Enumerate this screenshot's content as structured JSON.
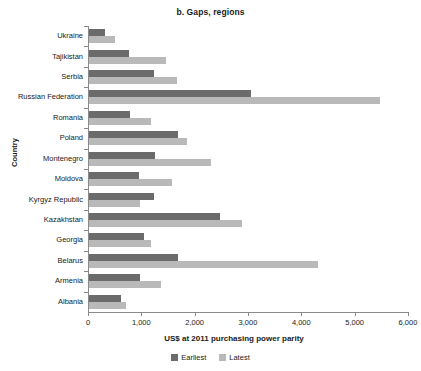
{
  "chart_data": {
    "type": "bar",
    "orientation": "horizontal",
    "title": "b. Gaps, regions",
    "xlabel": "US$ at 2011 purchasing power parity",
    "ylabel": "Country",
    "xlim": [
      0,
      6000
    ],
    "xticks": [
      0,
      1000,
      2000,
      3000,
      4000,
      5000,
      6000
    ],
    "xtick_labels": [
      "0",
      "1,000",
      "2,000",
      "3,000",
      "4,000",
      "5,000",
      "6,000"
    ],
    "grid": false,
    "legend_position": "bottom",
    "categories": [
      "Ukraine",
      "Tajikistan",
      "Serbia",
      "Russian Federation",
      "Romania",
      "Poland",
      "Montenegro",
      "Moldova",
      "Kyrgyz Republic",
      "Kazakhstan",
      "Georgia",
      "Belarus",
      "Armenia",
      "Albania"
    ],
    "series": [
      {
        "name": "Earliest",
        "color": "#6b6b6b",
        "values": [
          300,
          750,
          1220,
          3040,
          770,
          1670,
          1240,
          940,
          1220,
          2450,
          1030,
          1670,
          950,
          600
        ]
      },
      {
        "name": "Latest",
        "color": "#b9b9b9",
        "values": [
          490,
          1440,
          1650,
          5460,
          1160,
          1840,
          2280,
          1550,
          950,
          2870,
          1160,
          4290,
          1350,
          700
        ]
      }
    ]
  },
  "colors": {
    "earliest": "#6b6b6b",
    "latest": "#b9b9b9",
    "axis": "#8a8a8a",
    "text": "#1a1a1a",
    "background": "#ffffff"
  }
}
